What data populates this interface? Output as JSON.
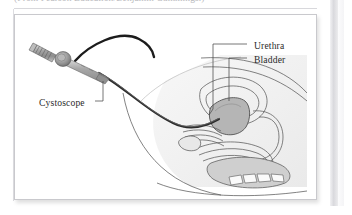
{
  "document": {
    "caption_clipped": "(From Pearson Education/Benjamin Cummings.)",
    "background_color": "#ffffff",
    "page_edge_color": "#d9d9dd"
  },
  "figure": {
    "name": "cystoscopy-illustration",
    "type": "medical-line-illustration",
    "border_color": "#c9c9cd",
    "background_color": "#ffffff",
    "ink_color": "#4a4a4a",
    "body_silhouette_color": "#efefef",
    "bladder_fill_color": "#b5b5b5",
    "tube_color": "#1f1f1f",
    "instrument_color": "#9a9a9a",
    "labels": [
      {
        "id": "urethra",
        "text": "Urethra",
        "x": 239,
        "y": 25,
        "leader": "horizontal-left-then-down-to-urethral-canal"
      },
      {
        "id": "bladder",
        "text": "Bladder",
        "x": 239,
        "y": 39,
        "leader": "horizontal-left-then-down-into-shaded-bladder"
      },
      {
        "id": "cystoscope",
        "text": "Cystoscope",
        "x": 24,
        "y": 82,
        "leader": "short-horizontal-right-then-up-to-instrument-shaft"
      }
    ],
    "parts": [
      {
        "id": "eyepiece",
        "label_text": "ribbed eyepiece"
      },
      {
        "id": "hub",
        "label_text": "circular hub"
      },
      {
        "id": "shaft",
        "label_text": "tapered rigid shaft"
      },
      {
        "id": "light-cable",
        "label_text": "curved light cable"
      },
      {
        "id": "flexible-tube",
        "label_text": "flexible scope tube"
      },
      {
        "id": "bladder-organ",
        "label_text": "bladder"
      },
      {
        "id": "urethra-canal",
        "label_text": "urethra"
      },
      {
        "id": "pelvic-anatomy",
        "label_text": "pelvic cross-section"
      },
      {
        "id": "vertebrae",
        "label_text": "sacral vertebrae"
      }
    ]
  }
}
